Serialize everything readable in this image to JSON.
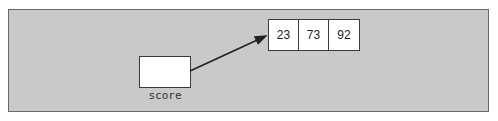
{
  "diagram": {
    "variable": {
      "name": "score"
    },
    "array": {
      "values": [
        "23",
        "73",
        "92"
      ]
    },
    "colors": {
      "panel": "#c9c9c9",
      "box": "#ffffff",
      "stroke": "#3a3a3a"
    }
  }
}
